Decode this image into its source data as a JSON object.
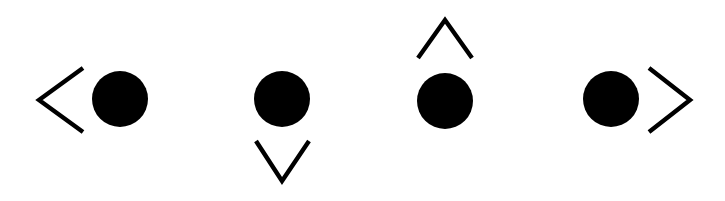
{
  "figure": {
    "width": 725,
    "height": 201,
    "background_color": "#ffffff",
    "ink_color": "#000000"
  },
  "style": {
    "dot_fill": "#000000",
    "chevron_stroke": "#000000",
    "chevron_stroke_width": 4.4,
    "dot_radius": 28
  },
  "glyphs": [
    {
      "id": "glyph-left",
      "name": "dot-with-chevron-left",
      "label": "chevron left then dot",
      "direction": "left",
      "chevron": {
        "icon_name": "chevron-left-icon",
        "glyph": "<",
        "points": "83,68 39,100 83,132",
        "apex_x": 39,
        "apex_y": 100
      },
      "dot": {
        "icon_name": "filled-circle-icon",
        "cx": 120,
        "cy": 99,
        "r": 28
      }
    },
    {
      "id": "glyph-down",
      "name": "dot-with-chevron-down",
      "label": "dot then chevron down",
      "direction": "down",
      "chevron": {
        "icon_name": "chevron-down-icon",
        "glyph": "v",
        "points": "256,141 282,181 309,141",
        "apex_x": 282,
        "apex_y": 181
      },
      "dot": {
        "icon_name": "filled-circle-icon",
        "cx": 282,
        "cy": 99,
        "r": 28
      }
    },
    {
      "id": "glyph-up",
      "name": "dot-with-chevron-up",
      "label": "chevron up then dot",
      "direction": "up",
      "chevron": {
        "icon_name": "chevron-up-icon",
        "glyph": "^",
        "points": "418,58 445,20 472,58",
        "apex_x": 445,
        "apex_y": 20
      },
      "dot": {
        "icon_name": "filled-circle-icon",
        "cx": 445,
        "cy": 101,
        "r": 28
      }
    },
    {
      "id": "glyph-right",
      "name": "dot-with-chevron-right",
      "label": "dot then chevron right",
      "direction": "right",
      "chevron": {
        "icon_name": "chevron-right-icon",
        "glyph": ">",
        "points": "649,68 690,100 649,132",
        "apex_x": 690,
        "apex_y": 100
      },
      "dot": {
        "icon_name": "filled-circle-icon",
        "cx": 611,
        "cy": 99,
        "r": 28
      }
    }
  ]
}
